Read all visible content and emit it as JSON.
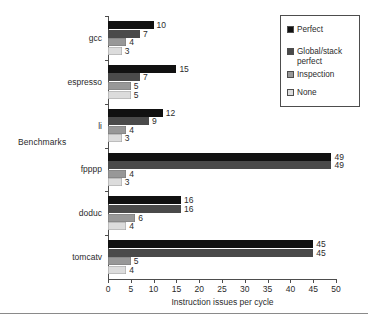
{
  "chart_data": {
    "type": "bar",
    "orientation": "horizontal",
    "title": "",
    "xlabel": "Instruction issues per cycle",
    "ylabel": "Benchmarks",
    "xlim": [
      0,
      50
    ],
    "xticks": [
      0,
      5,
      10,
      15,
      20,
      25,
      30,
      35,
      40,
      45,
      50
    ],
    "grid": false,
    "legend_position": "top-right",
    "categories": [
      "gcc",
      "espresso",
      "li",
      "fpppp",
      "doduc",
      "tomcatv"
    ],
    "series": [
      {
        "name": "Perfect",
        "color": "#111111",
        "values": [
          10,
          15,
          12,
          49,
          16,
          45
        ]
      },
      {
        "name": "Global/stack\nperfect",
        "color": "#4a4a4a",
        "values": [
          7,
          7,
          9,
          49,
          16,
          45
        ]
      },
      {
        "name": "Inspection",
        "color": "#989898",
        "values": [
          4,
          5,
          4,
          4,
          6,
          5
        ]
      },
      {
        "name": "None",
        "color": "#dcdcdc",
        "values": [
          3,
          5,
          3,
          3,
          4,
          4
        ]
      }
    ]
  },
  "axis": {
    "ylabel": "Benchmarks",
    "xlabel": "Instruction issues per cycle",
    "xticklabels": [
      "0",
      "5",
      "10",
      "15",
      "20",
      "25",
      "30",
      "35",
      "40",
      "45",
      "50"
    ],
    "categories": [
      "gcc",
      "espresso",
      "li",
      "fpppp",
      "doduc",
      "tomcatv"
    ]
  },
  "legend": {
    "entries": [
      {
        "label": "Perfect",
        "color": "#111111"
      },
      {
        "label": "Global/stack\nperfect",
        "color": "#4a4a4a"
      },
      {
        "label": "Inspection",
        "color": "#989898"
      },
      {
        "label": "None",
        "color": "#dcdcdc"
      }
    ]
  },
  "values": {
    "gcc": [
      "10",
      "7",
      "4",
      "3"
    ],
    "espresso": [
      "15",
      "7",
      "5",
      "5"
    ],
    "li": [
      "12",
      "9",
      "4",
      "3"
    ],
    "fpppp": [
      "49",
      "49",
      "4",
      "3"
    ],
    "doduc": [
      "16",
      "16",
      "6",
      "4"
    ],
    "tomcatv": [
      "45",
      "45",
      "5",
      "4"
    ]
  }
}
